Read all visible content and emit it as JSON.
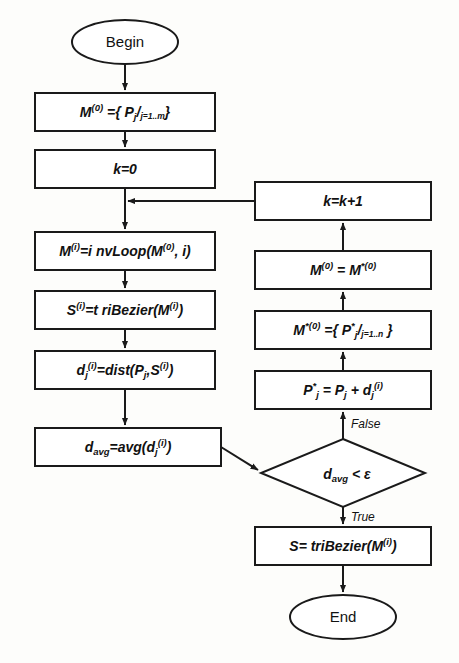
{
  "diagram": {
    "orientation": "top-to-bottom with feedback loop",
    "colors": {
      "background": "#fdfdfb",
      "stroke": "#1a1a1a",
      "fill": "#ffffff",
      "text": "#111111"
    }
  },
  "nodes": {
    "begin": {
      "label": "Begin",
      "shape": "ellipse",
      "cx": 125,
      "cy": 42,
      "rx": 53,
      "ry": 22
    },
    "init_m0": {
      "shape": "process",
      "x": 35,
      "y": 93,
      "w": 180,
      "h": 38,
      "base": "M",
      "sup": "(0)",
      "rest": " ={ ",
      "p": "P",
      "p_sub": "j",
      "slash": "/",
      "range": "j=1..m",
      "close": "}",
      "plain": "M(0) ={ Pj / j=1..m }"
    },
    "k_zero": {
      "shape": "process",
      "x": 35,
      "y": 150,
      "w": 180,
      "h": 38,
      "plain": "k=0"
    },
    "k_increment": {
      "shape": "process",
      "x": 255,
      "y": 182,
      "w": 176,
      "h": 38,
      "plain": "k=k+1"
    },
    "inv_loop": {
      "shape": "process",
      "x": 35,
      "y": 232,
      "w": 180,
      "h": 38,
      "base": "M",
      "sup": "(i)",
      "rest": "=i nvLoop(M",
      "sup2": "(0)",
      "tail": ", i)",
      "plain": "M(i)=i nvLoop(M(0), i)"
    },
    "tri_bezier_s": {
      "shape": "process",
      "x": 35,
      "y": 291,
      "w": 180,
      "h": 38,
      "base": "S",
      "sup": "(i)",
      "rest": "=t riBezier(M",
      "sup2": "(i)",
      "tail": ")",
      "plain": "S(i)=t riBezier(M(i))"
    },
    "dist_calc": {
      "shape": "process",
      "x": 35,
      "y": 351,
      "w": 180,
      "h": 38,
      "base": "d",
      "sub": "j",
      "sup": "(i)",
      "rest": "=dist(P",
      "sub2": "j",
      "mid": ",S",
      "sup2": "(i)",
      "tail": ")",
      "plain": "dj(i)=dist(Pj,S(i))"
    },
    "d_avg": {
      "shape": "process",
      "x": 35,
      "y": 428,
      "w": 186,
      "h": 38,
      "base": "d",
      "sub": "avg",
      "rest": "=avg(d",
      "sub2": "j",
      "sup2": "(i)",
      "tail": ")",
      "plain": "davg=avg(dj(i))"
    },
    "decision": {
      "shape": "diamond",
      "cx": 343,
      "cy": 473,
      "rx": 82,
      "ry": 34,
      "base": "d",
      "sub": "avg",
      "rest": " < ",
      "epsilon": "ε",
      "plain": "davg < ε"
    },
    "p_star": {
      "shape": "process",
      "x": 255,
      "y": 371,
      "w": 176,
      "h": 38,
      "base": "P",
      "star": "*",
      "sub": "j",
      "rest": " = P",
      "sub2": "j",
      "mid": " + d",
      "sub3": "j",
      "sup2": "(i)",
      "plain": "P*j = Pj + dj(i)"
    },
    "m_star_set": {
      "shape": "process",
      "x": 255,
      "y": 311,
      "w": 176,
      "h": 38,
      "base": "M",
      "sup": "*(0)",
      "rest": " ={ ",
      "p": "P",
      "star": "*",
      "p_sub": "j",
      "slash": "/",
      "range": "j=1..n",
      "close": " }",
      "plain": "M*(0) ={ P*j / j=1..n }"
    },
    "m_assign": {
      "shape": "process",
      "x": 255,
      "y": 251,
      "w": 176,
      "h": 38,
      "base": "M",
      "sup": "(0)",
      "rest": " = M",
      "sup2": "*(0)",
      "plain": "M(0) = M*(0)"
    },
    "final_bezier": {
      "shape": "process",
      "x": 255,
      "y": 527,
      "w": 176,
      "h": 38,
      "base": "S",
      "rest": "= triBezier(M",
      "sup2": "(i)",
      "tail": ")",
      "plain": "S= triBezier(M(i))"
    },
    "end": {
      "label": "End",
      "shape": "ellipse",
      "cx": 343,
      "cy": 617,
      "rx": 53,
      "ry": 22
    }
  },
  "edge_labels": {
    "false": "False",
    "true": "True"
  }
}
